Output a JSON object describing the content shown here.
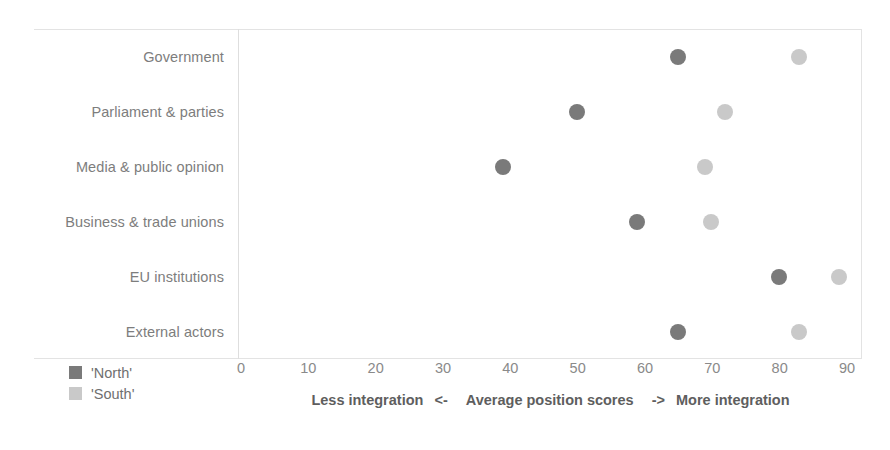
{
  "chart_data": {
    "type": "scatter",
    "title": "",
    "subtitle": "",
    "xlabel": "Less integration <-  Average position scores  -> More integration",
    "ylabel": "",
    "xlim": [
      0,
      90
    ],
    "grid": false,
    "legend_position": "bottom-left",
    "orientation": "horizontal",
    "categories": [
      "Government",
      "Parliament & parties",
      "Media & public opinion",
      "Business & trade unions",
      "EU institutions",
      "External actors"
    ],
    "series": [
      {
        "name": "'North'",
        "color": "#7a7a7a",
        "values": [
          65,
          50,
          39,
          59,
          80,
          65
        ]
      },
      {
        "name": "'South'",
        "color": "#c9c9c9",
        "values": [
          83,
          72,
          69,
          70,
          89,
          83
        ]
      }
    ],
    "x_ticks": [
      0,
      10,
      20,
      30,
      40,
      50,
      60,
      70,
      80,
      90
    ],
    "x_tick_labels": [
      "0",
      "10",
      "20",
      "30",
      "40",
      "50",
      "60",
      "70",
      "80",
      "90"
    ],
    "annotations": []
  },
  "axis_caption": {
    "left": "Less integration",
    "left_arrow": "<-",
    "center": "Average position scores",
    "right_arrow": "->",
    "right": "More integration"
  },
  "legend": {
    "items": [
      {
        "label": "'North'",
        "color": "#7a7a7a"
      },
      {
        "label": "'South'",
        "color": "#c9c9c9"
      }
    ]
  },
  "colors": {
    "north": "#7a7a7a",
    "south": "#c9c9c9",
    "frame": "#e3e3e3",
    "axis": "#dedede",
    "text": "#6f6f6f",
    "background": "#ffffff"
  }
}
